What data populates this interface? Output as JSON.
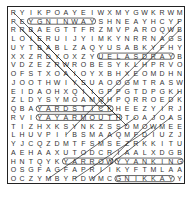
{
  "puzzle": {
    "type": "word-search",
    "rows": 20,
    "cols": 20,
    "grid": [
      "RYIKPOAYEIWXMYGWKRWM",
      "PEYGNINWAYSHNEAYHCYP",
      "RRBAEGTTFRZMVPAROQWB",
      "LOIERUIJYIMKYNRRNAGS",
      "UYTBABLZAQYUSABKYFHY",
      "XXZRDYOXZYUELASDRAYB",
      "VDZEZRWROBESYKLHPRVO",
      "OFSTXOAIOYXBHXEOMDHN",
      "JOOTHWIYSUAOOGMTRASW",
      "EIDAOHXQIIGPPGTDPGKH",
      "ZLDYSYMOAMQHPQRROEDK",
      "QBAYARDSTICKHEEZYIRJ",
      "RVIYAYARMOUTHTOAJOAS",
      "TIZHXKSYNKZSSDMOWMEE",
      "LHUVPIIBSMAAQMFDIUZJ",
      "YJCQZDMTFSMSEZRKKITU",
      "AEHAAXUTODCRIAALXDGB",
      "HNTQYKYARROWYYANKING",
      "OSGFAGFAPRIIKYFTMLAA",
      "OCZYMBYRDWMCGNIKKAYY"
    ],
    "found_words_visible": [
      "YARDSTICK",
      "YARMOUTH",
      "YANKING",
      "ARROW",
      "GNIKKAY",
      "YARDSALE",
      "GNINWAY"
    ],
    "mark_color": "#222222"
  }
}
